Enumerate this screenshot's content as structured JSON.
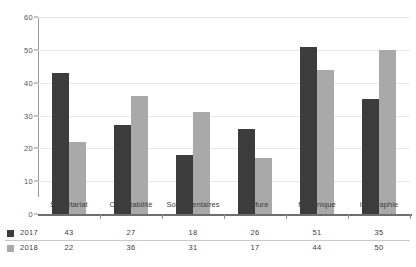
{
  "chart_data": {
    "type": "bar",
    "title": "",
    "subtitle": "",
    "xlabel": "",
    "ylabel": "",
    "ylim": [
      0,
      60
    ],
    "yticks": [
      0,
      10,
      20,
      30,
      40,
      50,
      60
    ],
    "grid": true,
    "legend_position": "bottom-left",
    "categories": [
      "Secrétariat",
      "Comptabilité",
      "Soins dentaires",
      "Coiffure",
      "Mécanique",
      "Infographie"
    ],
    "series": [
      {
        "name": "2017",
        "color": "#3c3c3c",
        "values": [
          43,
          27,
          18,
          26,
          51,
          35
        ]
      },
      {
        "name": "2018",
        "color": "#a9a9a9",
        "values": [
          22,
          36,
          31,
          17,
          44,
          50
        ]
      }
    ]
  },
  "colors": {
    "series_2017": "#3c3c3c",
    "series_2018": "#a9a9a9",
    "gridline": "#e9e9e9",
    "axis": "#6e6e6e",
    "text": "#3d3d3d",
    "background": "#ffffff"
  }
}
